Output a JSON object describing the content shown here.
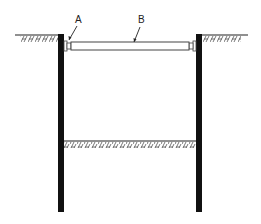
{
  "diagram": {
    "labels": {
      "a": "A",
      "b": "B"
    },
    "components": {
      "left_wall": "retaining-wall",
      "right_wall": "retaining-wall",
      "strut": "horizontal-strut",
      "connector_left": "waler-connector",
      "connector_right": "waler-connector",
      "ground_left": "ground-surface",
      "ground_right": "ground-surface",
      "excavation_base": "excavation-level"
    },
    "colors": {
      "wall": "#111111",
      "line": "#333333",
      "strut_fill": "#ffffff"
    }
  }
}
